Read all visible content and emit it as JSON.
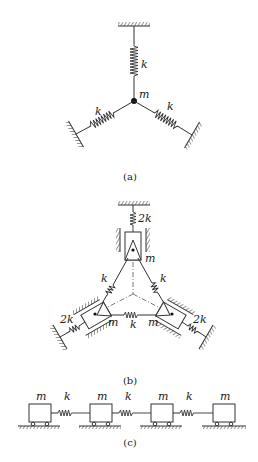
{
  "figure": {
    "panels": [
      {
        "id": "a",
        "caption": "(a)",
        "description": "Point mass m connected to three fixed walls by three springs k arranged at 120 degrees",
        "labels": {
          "mass": "m",
          "spring_top": "k",
          "spring_left": "k",
          "spring_right": "k"
        }
      },
      {
        "id": "b",
        "caption": "(b)",
        "description": "Three masses m on guided sliders forming a triangle, connected by springs k, each grounded by spring 2k",
        "labels": {
          "mass_top": "m",
          "mass_left": "m",
          "mass_right": "m",
          "spring_left_side": "k",
          "spring_right_side": "k",
          "spring_bottom": "k",
          "ground_spring_top": "2k",
          "ground_spring_left": "2k",
          "ground_spring_right": "2k"
        }
      },
      {
        "id": "c",
        "caption": "(c)",
        "description": "Four masses m on rollers connected in a chain by three springs k",
        "labels": {
          "masses": [
            "m",
            "m",
            "m",
            "m"
          ],
          "springs": [
            "k",
            "k",
            "k"
          ]
        }
      }
    ]
  }
}
